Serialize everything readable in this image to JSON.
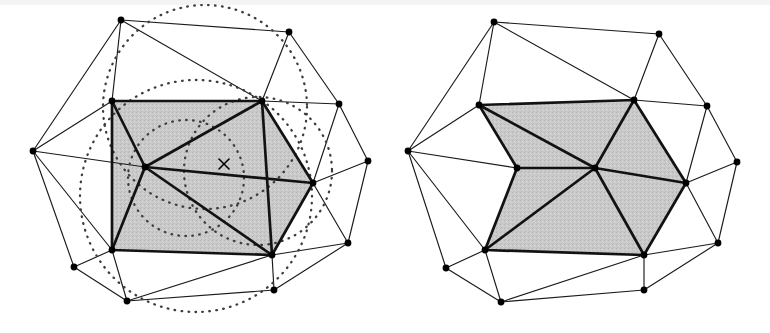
{
  "figure": {
    "background_color": "#ffffff",
    "width": 770,
    "height": 333,
    "panel_count": 2
  },
  "style": {
    "edge_color": "#1a1a1a",
    "bold_edge_color": "#121212",
    "cavity_fill_color": "#c9c9c9",
    "circle_stroke_color": "#3d3d3d",
    "vertex_color": "#000000",
    "edge_width": 1.15,
    "bold_edge_width": 2.7,
    "circle_width": 2.3,
    "vertex_radius": 3.4
  },
  "panels": [
    {
      "id": "left-panel",
      "name": "cavity-with-circumcircles",
      "description": "Triangulation showing the inserted point and the circumcircles of triangles whose circumdisc contains it",
      "has_circumcircles": true,
      "has_inserted_point": true,
      "inserted_point": {
        "x": 224,
        "y": 164,
        "marker": "x",
        "size": 5
      },
      "vertices": [
        {
          "id": "L0",
          "x": 121,
          "y": 20,
          "label": "top-left-apex"
        },
        {
          "id": "L1",
          "x": 289,
          "y": 32,
          "label": "top-right-apex"
        },
        {
          "id": "L2",
          "x": 33,
          "y": 151,
          "label": "left-apex"
        },
        {
          "id": "L3",
          "x": 112,
          "y": 101,
          "label": "cavity-upper-left"
        },
        {
          "id": "L4",
          "x": 262,
          "y": 101,
          "label": "cavity-upper-right"
        },
        {
          "id": "L5",
          "x": 145,
          "y": 167,
          "label": "cavity-hub"
        },
        {
          "id": "L6",
          "x": 313,
          "y": 183,
          "label": "cavity-right"
        },
        {
          "id": "L7",
          "x": 112,
          "y": 250,
          "label": "cavity-lower-left"
        },
        {
          "id": "L8",
          "x": 272,
          "y": 255,
          "label": "cavity-lower-right"
        },
        {
          "id": "L9",
          "x": 339,
          "y": 104,
          "label": "right-upper-apex"
        },
        {
          "id": "L10",
          "x": 368,
          "y": 161,
          "label": "right-apex"
        },
        {
          "id": "L11",
          "x": 348,
          "y": 243,
          "label": "right-lower-apex"
        },
        {
          "id": "L12",
          "x": 74,
          "y": 267,
          "label": "lower-left-apex"
        },
        {
          "id": "L13",
          "x": 127,
          "y": 301,
          "label": "bottom-apex"
        },
        {
          "id": "L14",
          "x": 274,
          "y": 290,
          "label": "bottom-right-apex"
        }
      ],
      "cavity_boundary": [
        "L3",
        "L4",
        "L6",
        "L8",
        "L7"
      ],
      "cavity_interior_edges": [
        [
          "L5",
          "L3"
        ],
        [
          "L5",
          "L4"
        ],
        [
          "L5",
          "L6"
        ],
        [
          "L5",
          "L8"
        ],
        [
          "L5",
          "L7"
        ],
        [
          "L4",
          "L8"
        ]
      ],
      "outer_edges": [
        [
          "L0",
          "L1"
        ],
        [
          "L0",
          "L2"
        ],
        [
          "L0",
          "L3"
        ],
        [
          "L0",
          "L4"
        ],
        [
          "L1",
          "L4"
        ],
        [
          "L1",
          "L9"
        ],
        [
          "L2",
          "L3"
        ],
        [
          "L2",
          "L5"
        ],
        [
          "L2",
          "L7"
        ],
        [
          "L2",
          "L12"
        ],
        [
          "L4",
          "L9"
        ],
        [
          "L9",
          "L6"
        ],
        [
          "L9",
          "L10"
        ],
        [
          "L6",
          "L10"
        ],
        [
          "L10",
          "L11"
        ],
        [
          "L6",
          "L11"
        ],
        [
          "L8",
          "L11"
        ],
        [
          "L8",
          "L14"
        ],
        [
          "L11",
          "L14"
        ],
        [
          "L7",
          "L12"
        ],
        [
          "L7",
          "L13"
        ],
        [
          "L12",
          "L13"
        ],
        [
          "L13",
          "L14"
        ],
        [
          "L8",
          "L13"
        ]
      ],
      "circumcircles": [
        {
          "cx": 205,
          "cy": 107,
          "r": 102,
          "name": "circumcircle-upper"
        },
        {
          "cx": 196,
          "cy": 196,
          "r": 116,
          "name": "circumcircle-lower-left"
        },
        {
          "cx": 258,
          "cy": 171,
          "r": 74,
          "name": "circumcircle-right"
        },
        {
          "cx": 186,
          "cy": 178,
          "r": 58,
          "name": "circumcircle-inner"
        }
      ]
    },
    {
      "id": "right-panel",
      "name": "cavity-retriangulated",
      "description": "Same mesh after the cavity has been retriangulated by connecting the inserted point to every cavity boundary vertex",
      "has_circumcircles": false,
      "has_inserted_point": false,
      "vertices": [
        {
          "id": "R0",
          "x": 494,
          "y": 22,
          "label": "top-left-apex"
        },
        {
          "id": "R1",
          "x": 659,
          "y": 34,
          "label": "top-right-apex"
        },
        {
          "id": "R2",
          "x": 408,
          "y": 151,
          "label": "left-apex"
        },
        {
          "id": "R3",
          "x": 479,
          "y": 105,
          "label": "cavity-upper-left"
        },
        {
          "id": "R4",
          "x": 634,
          "y": 100,
          "label": "cavity-upper-right"
        },
        {
          "id": "R5",
          "x": 517,
          "y": 168,
          "label": "cavity-reflex-left"
        },
        {
          "id": "R6",
          "x": 595,
          "y": 168,
          "label": "cavity-hub"
        },
        {
          "id": "R7",
          "x": 686,
          "y": 183,
          "label": "cavity-right"
        },
        {
          "id": "R8",
          "x": 485,
          "y": 250,
          "label": "cavity-lower-left"
        },
        {
          "id": "R9",
          "x": 644,
          "y": 255,
          "label": "cavity-lower-right"
        },
        {
          "id": "R10",
          "x": 707,
          "y": 106,
          "label": "right-upper-apex"
        },
        {
          "id": "R11",
          "x": 737,
          "y": 162,
          "label": "right-apex"
        },
        {
          "id": "R12",
          "x": 718,
          "y": 243,
          "label": "right-lower-apex"
        },
        {
          "id": "R13",
          "x": 446,
          "y": 268,
          "label": "lower-left-apex"
        },
        {
          "id": "R14",
          "x": 501,
          "y": 302,
          "label": "bottom-apex"
        },
        {
          "id": "R15",
          "x": 644,
          "y": 290,
          "label": "bottom-right-apex"
        }
      ],
      "cavity_boundary": [
        "R3",
        "R4",
        "R7",
        "R9",
        "R8",
        "R5"
      ],
      "cavity_interior_edges": [
        [
          "R6",
          "R3"
        ],
        [
          "R6",
          "R4"
        ],
        [
          "R6",
          "R7"
        ],
        [
          "R6",
          "R9"
        ],
        [
          "R6",
          "R8"
        ],
        [
          "R6",
          "R5"
        ]
      ],
      "outer_edges": [
        [
          "R0",
          "R1"
        ],
        [
          "R0",
          "R2"
        ],
        [
          "R0",
          "R3"
        ],
        [
          "R0",
          "R4"
        ],
        [
          "R1",
          "R4"
        ],
        [
          "R1",
          "R10"
        ],
        [
          "R2",
          "R3"
        ],
        [
          "R2",
          "R5"
        ],
        [
          "R2",
          "R8"
        ],
        [
          "R2",
          "R13"
        ],
        [
          "R4",
          "R10"
        ],
        [
          "R10",
          "R7"
        ],
        [
          "R10",
          "R11"
        ],
        [
          "R7",
          "R11"
        ],
        [
          "R11",
          "R12"
        ],
        [
          "R7",
          "R12"
        ],
        [
          "R9",
          "R12"
        ],
        [
          "R9",
          "R15"
        ],
        [
          "R12",
          "R15"
        ],
        [
          "R8",
          "R13"
        ],
        [
          "R8",
          "R14"
        ],
        [
          "R13",
          "R14"
        ],
        [
          "R14",
          "R15"
        ],
        [
          "R9",
          "R14"
        ]
      ]
    }
  ]
}
